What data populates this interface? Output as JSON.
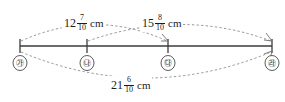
{
  "figure": {
    "type": "number-line-segment-diagram",
    "axis": {
      "start_x": 20,
      "end_x": 272,
      "y": 46
    },
    "points": [
      {
        "id": "ga",
        "label": "㉮",
        "x": 20
      },
      {
        "id": "na",
        "label": "㉯",
        "x": 87
      },
      {
        "id": "da",
        "label": "㉰",
        "x": 168
      },
      {
        "id": "ra",
        "label": "㉱",
        "x": 272
      }
    ],
    "measurements": [
      {
        "id": "ga-to-da",
        "whole": "12",
        "numerator": "7",
        "denominator": "10",
        "unit": "cm",
        "from": "ga",
        "to": "da",
        "position": "above"
      },
      {
        "id": "na-to-ra",
        "whole": "15",
        "numerator": "8",
        "denominator": "10",
        "unit": "cm",
        "from": "na",
        "to": "ra",
        "position": "above"
      },
      {
        "id": "ga-to-ra",
        "whole": "21",
        "numerator": "6",
        "denominator": "10",
        "unit": "cm",
        "from": "ga",
        "to": "ra",
        "position": "below"
      }
    ]
  },
  "colors": {
    "line": "#3b3b3b",
    "arc": "#8a8a8a",
    "text": "#1d1d1d",
    "background": "#ffffff"
  }
}
